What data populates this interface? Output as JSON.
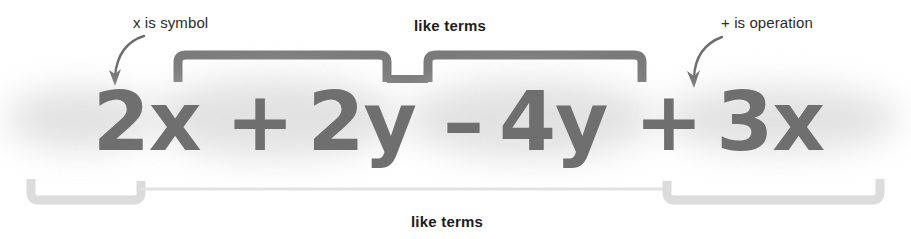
{
  "figure": {
    "width": 911,
    "height": 239,
    "background_color": "#ffffff"
  },
  "colors": {
    "expression_text": "#6f6f6f",
    "expression_glow": "#d8d8d8",
    "top_bracket": "#7a7a7a",
    "bottom_bracket": "#dcdcdc",
    "bottom_connector": "#e2e2e2",
    "arrow": "#6d6d6d",
    "label_text": "#2b2b2b",
    "label_text_bold": "#1d1d1d"
  },
  "expression": {
    "full_text": "2x + 2y – 4y + 3x",
    "terms": [
      {
        "id": "2x",
        "text": "2x",
        "coefficient": "2",
        "variable": "x",
        "kind": "term"
      },
      {
        "id": "plus1",
        "text": "+",
        "kind": "operator",
        "name": "plus"
      },
      {
        "id": "2y",
        "text": "2y",
        "coefficient": "2",
        "variable": "y",
        "kind": "term"
      },
      {
        "id": "minus",
        "text": "–",
        "kind": "operator",
        "name": "minus"
      },
      {
        "id": "4y",
        "text": "4y",
        "coefficient": "4",
        "variable": "y",
        "kind": "term"
      },
      {
        "id": "plus2",
        "text": "+",
        "kind": "operator",
        "name": "plus"
      },
      {
        "id": "3x",
        "text": "3x",
        "coefficient": "3",
        "variable": "x",
        "kind": "term"
      }
    ]
  },
  "annotations": {
    "x_is_symbol": {
      "label": "x is symbol",
      "points_to": "x in 2x",
      "arrow": "curved-arrow-down-left"
    },
    "plus_is_operation": {
      "label": "+ is operation",
      "points_to": "+ before 3x",
      "arrow": "curved-arrow-down"
    },
    "like_terms_top": {
      "label": "like terms",
      "groups": "2y and 4y",
      "bracket": "double-bracket-above"
    },
    "like_terms_bottom": {
      "label": "like terms",
      "groups": "2x and 3x",
      "bracket": "double-bracket-below"
    }
  }
}
